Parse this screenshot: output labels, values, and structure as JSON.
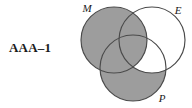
{
  "figure": {
    "syllogism_label": "AAA–1",
    "type": "three-circle-venn-diagram"
  },
  "venn": {
    "stroke_color": "#4a4a4a",
    "shade_color": "#9d9d9d",
    "empty_color": "#ffffff",
    "circles": [
      {
        "id": "M",
        "label": "M",
        "cx": 40,
        "cy": 40,
        "r": 33
      },
      {
        "id": "E",
        "label": "E",
        "cx": 78,
        "cy": 40,
        "r": 33
      },
      {
        "id": "P",
        "label": "P",
        "cx": 59,
        "cy": 68,
        "r": 33
      }
    ],
    "labels": [
      {
        "for": "M",
        "text": "M",
        "x": 13,
        "y": 12
      },
      {
        "for": "E",
        "text": "E",
        "x": 104,
        "y": 14
      },
      {
        "for": "P",
        "text": "P",
        "x": 88,
        "y": 102
      }
    ],
    "regions": [
      {
        "id": "M-only",
        "name": "M not E not P",
        "shaded": true
      },
      {
        "id": "ME-only",
        "name": "M and E not P",
        "shaded": true
      },
      {
        "id": "MP-only",
        "name": "M and P not E",
        "shaded": true
      },
      {
        "id": "MEP",
        "name": "M and E and P",
        "shaded": false
      },
      {
        "id": "E-only",
        "name": "E not M not P",
        "shaded": false
      },
      {
        "id": "EP-only",
        "name": "E and P not M",
        "shaded": false
      },
      {
        "id": "P-only",
        "name": "P not M not E",
        "shaded": true
      }
    ]
  }
}
